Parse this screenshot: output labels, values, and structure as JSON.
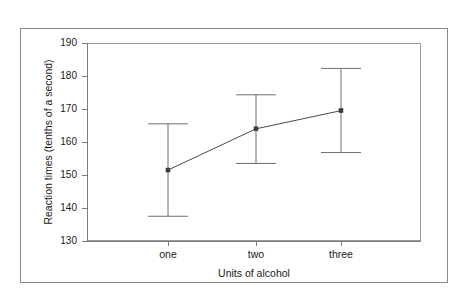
{
  "chart_data": {
    "type": "line",
    "title": "",
    "subtitle": "",
    "xlabel": "Units of alcohol",
    "ylabel": "Reaction times (tenths of a second)",
    "categories": [
      "one",
      "two",
      "three"
    ],
    "values": [
      151.5,
      164.0,
      169.5
    ],
    "error_bars": {
      "upper": [
        165.5,
        174.3,
        182.3
      ],
      "lower": [
        137.5,
        153.5,
        156.8
      ]
    },
    "series": [
      {
        "name": "Mean reaction time",
        "values": [
          151.5,
          164.0,
          169.5
        ],
        "error_upper": [
          165.5,
          174.3,
          182.3
        ],
        "error_lower": [
          137.5,
          153.5,
          156.8
        ]
      }
    ],
    "ylim": [
      130,
      190
    ],
    "yticks": [
      130,
      140,
      150,
      160,
      170,
      180,
      190
    ],
    "ytick_labels": [
      "130",
      "140",
      "150",
      "160",
      "170",
      "180",
      "190"
    ],
    "xticks": [
      "one",
      "two",
      "three"
    ],
    "grid": false,
    "legend": false,
    "legend_position": "none",
    "marker_style": "square",
    "colors": {
      "line": "#4a4a4a",
      "marker": "#3a3a3a",
      "error_bar": "#6e6e6e",
      "axis": "#7d7d7d",
      "plot_border": "#9a9a9a",
      "figure_border": "#8a8a8a",
      "background": "#ffffff",
      "text": "#1a1a1a"
    }
  },
  "axes": {
    "y_title": "Reaction times (tenths of a second)",
    "x_title": "Units of alcohol",
    "y_labels": [
      "190",
      "180",
      "170",
      "160",
      "150",
      "140",
      "130"
    ],
    "x_labels": [
      "one",
      "two",
      "three"
    ]
  }
}
